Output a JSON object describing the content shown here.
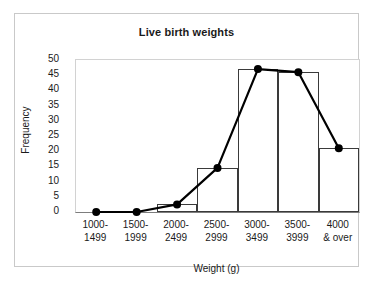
{
  "chart_data": {
    "type": "bar",
    "title": "Live birth weights",
    "xlabel": "Weight (g)",
    "ylabel": "Frequency",
    "categories": [
      "1000-\n1499",
      "1500-\n1999",
      "2000-\n2499",
      "2500-\n2999",
      "3000-\n3499",
      "3500-\n3999",
      "4000\n& over"
    ],
    "category_labels_flat": [
      "1000-1499",
      "1500-1999",
      "2000-2499",
      "2500-2999",
      "3000-3499",
      "3500-3999",
      "4000 & over"
    ],
    "values": [
      0,
      0,
      2.5,
      14.5,
      47,
      46,
      21
    ],
    "series": [
      {
        "name": "Histogram bars",
        "type": "bar",
        "values": [
          0,
          0,
          2.5,
          14.5,
          47,
          46,
          21
        ]
      },
      {
        "name": "Frequency polygon",
        "type": "line",
        "marker": "filled-circle",
        "values": [
          0,
          0,
          2.5,
          14.5,
          47,
          46,
          21
        ]
      }
    ],
    "ylim": [
      0,
      50
    ],
    "ytick_values": [
      0,
      5,
      10,
      15,
      20,
      25,
      30,
      35,
      40,
      45,
      50
    ],
    "ytick_labels": [
      "0",
      "5",
      "10",
      "15",
      "20",
      "25",
      "30",
      "35",
      "40",
      "45",
      "50"
    ],
    "grid": false,
    "legend": null,
    "colors": {
      "bar_outline": "#3a3a3a",
      "bar_fill": "#ffffff",
      "line": "#000000",
      "marker": "#000000",
      "axis": "#7d7d7d",
      "plot_border": "#d2d2d2",
      "frame": "#c9c9c9",
      "text": "#1a1a1a",
      "background": "#ffffff"
    }
  }
}
